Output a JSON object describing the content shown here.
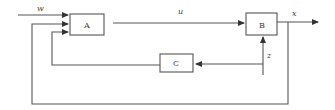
{
  "diagram": {
    "type": "block-diagram",
    "blocks": [
      {
        "id": "A",
        "label": "A"
      },
      {
        "id": "B",
        "label": "B"
      },
      {
        "id": "C",
        "label": "C"
      }
    ],
    "signals": {
      "w": "w",
      "u": "u",
      "x": "x",
      "z": "z"
    },
    "connections": [
      {
        "from": "input",
        "to": "A",
        "signal": "w"
      },
      {
        "from": "A",
        "to": "B",
        "signal": "u"
      },
      {
        "from": "B",
        "to": "output",
        "signal": "x"
      },
      {
        "from": "x",
        "to": "A",
        "signal": "feedback"
      },
      {
        "from": "z",
        "to": "B",
        "signal": "z"
      },
      {
        "from": "z",
        "to": "C",
        "signal": "z"
      },
      {
        "from": "C",
        "to": "A",
        "signal": "feedback"
      }
    ],
    "colors": {
      "line": "#555555",
      "text": "#444444",
      "background": "#ffffff"
    }
  }
}
